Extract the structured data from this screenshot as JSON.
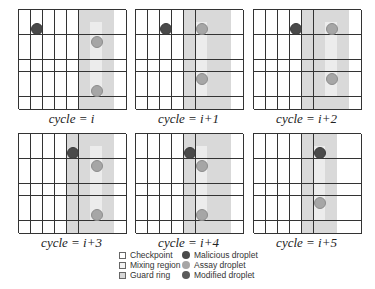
{
  "diagram": {
    "grid": {
      "cols": 9,
      "rows": 8
    },
    "colors": {
      "grid_line": "#333333",
      "cell": "#ffffff",
      "guard_ring": "#d6d6d6",
      "mixing_region": "#ececec",
      "malicious": "#4a4a4a",
      "assay": "#a6a6a6",
      "modified": "#4a4a4a"
    },
    "panels": [
      {
        "caption": "cycle = i",
        "x": 18,
        "y": 9,
        "guard_cols": [
          5,
          6,
          7
        ],
        "mix_col": 6,
        "droplets": [
          {
            "type": "malicious",
            "col": 1,
            "row": 1
          },
          {
            "type": "assay",
            "col": 6,
            "row": 2
          },
          {
            "type": "assay",
            "col": 6,
            "row": 6
          }
        ]
      },
      {
        "caption": "cycle = i+1",
        "x": 135,
        "y": 9,
        "guard_cols": [
          4,
          5,
          6,
          7
        ],
        "mix_col": 5,
        "droplets": [
          {
            "type": "malicious",
            "col": 2,
            "row": 1
          },
          {
            "type": "assay",
            "col": 5,
            "row": 1
          },
          {
            "type": "assay",
            "col": 5,
            "row": 5
          }
        ]
      },
      {
        "caption": "cycle = i+2",
        "x": 253,
        "y": 9,
        "guard_cols": [
          4,
          5,
          6,
          7
        ],
        "mix_col": 6,
        "droplets": [
          {
            "type": "malicious",
            "col": 3,
            "row": 1
          },
          {
            "type": "assay",
            "col": 6,
            "row": 1
          },
          {
            "type": "assay",
            "col": 6,
            "row": 5
          }
        ]
      },
      {
        "caption": "cycle = i+3",
        "x": 18,
        "y": 133,
        "guard_cols": [
          4,
          5,
          6,
          7
        ],
        "mix_col": 6,
        "droplets": [
          {
            "type": "malicious",
            "col": 4,
            "row": 1
          },
          {
            "type": "assay",
            "col": 6,
            "row": 2
          },
          {
            "type": "assay",
            "col": 6,
            "row": 6
          }
        ]
      },
      {
        "caption": "cycle = i+4",
        "x": 135,
        "y": 133,
        "guard_cols": [
          4,
          5,
          6,
          7
        ],
        "mix_col": 5,
        "droplets": [
          {
            "type": "malicious",
            "col": 4,
            "row": 1
          },
          {
            "type": "assay",
            "col": 5,
            "row": 2
          },
          {
            "type": "assay",
            "col": 5,
            "row": 6
          }
        ]
      },
      {
        "caption": "cycle = i+5",
        "x": 253,
        "y": 133,
        "guard_cols": [
          4,
          5,
          6
        ],
        "mix_col": 5,
        "droplets": [
          {
            "type": "modified",
            "col": 5,
            "row": 1
          },
          {
            "type": "assay",
            "col": 5,
            "row": 5
          }
        ]
      }
    ],
    "legend": {
      "checkpoint": "Checkpoint",
      "mixing_region": "Mixing region",
      "guard_ring": "Guard ring",
      "malicious_droplet": "Malicious droplet",
      "assay_droplet": "Assay droplet",
      "modified_droplet": "Modified droplet"
    }
  }
}
